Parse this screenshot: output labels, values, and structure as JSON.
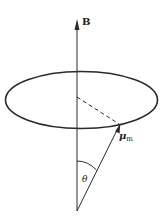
{
  "diagram": {
    "type": "precession-of-magnetic-moment",
    "labels": {
      "field": "B",
      "moment": "μ",
      "moment_subscript": "m",
      "angle": "θ"
    },
    "colors": {
      "stroke": "#2a2a2a",
      "background": "#ffffff"
    }
  }
}
